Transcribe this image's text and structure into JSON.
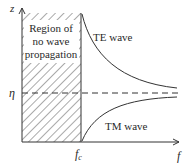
{
  "diagram": {
    "axes": {
      "y_label": "z",
      "x_label": "f"
    },
    "region": {
      "label_lines": [
        "Region of",
        "no wave",
        "propagation"
      ]
    },
    "reference_line": {
      "label": "η",
      "style": "dashed"
    },
    "cutoff": {
      "label": "f",
      "subscript": "c"
    },
    "curves": [
      {
        "name": "TE wave",
        "label": "TE wave",
        "trend": "decreasing toward η from above"
      },
      {
        "name": "TM wave",
        "label": "TM wave",
        "trend": "increasing toward η from below"
      }
    ],
    "colors": {
      "line": "#333333",
      "hatch": "#555555",
      "background": "#ffffff"
    }
  }
}
